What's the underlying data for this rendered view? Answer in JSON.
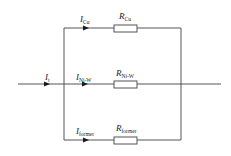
{
  "diagram": {
    "type": "parallel-resistor-circuit",
    "colors": {
      "wire": "#555555",
      "arrow": "#1a1a1a",
      "text": "#222222",
      "background": "#ffffff"
    },
    "input_current": {
      "symbol": "I",
      "subscript": "t"
    },
    "branches": [
      {
        "id": "cu",
        "current": {
          "symbol": "I",
          "subscript": "Cu"
        },
        "resistor": {
          "symbol": "R",
          "subscript": "Cu"
        }
      },
      {
        "id": "ni-w",
        "current": {
          "symbol": "I",
          "subscript": "Ni-W"
        },
        "resistor": {
          "symbol": "R",
          "subscript": "Ni-W"
        }
      },
      {
        "id": "former",
        "current": {
          "symbol": "I",
          "subscript": "former"
        },
        "resistor": {
          "symbol": "R",
          "subscript": "former"
        }
      }
    ]
  }
}
